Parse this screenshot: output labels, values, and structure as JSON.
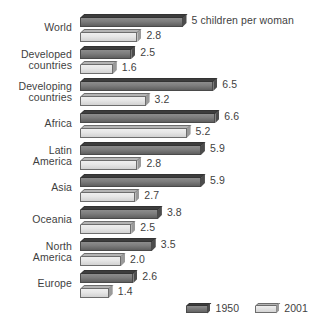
{
  "chart_data": {
    "type": "bar",
    "orientation": "horizontal",
    "title": "",
    "subtitle": "",
    "xlabel": "",
    "ylabel": "",
    "unit_note": "5 children per woman",
    "categories": [
      "World",
      "Developed\ncountries",
      "Developing\ncountries",
      "Africa",
      "Latin\nAmerica",
      "Asia",
      "Oceania",
      "North\nAmerica",
      "Europe"
    ],
    "series": [
      {
        "name": "1950",
        "color": "#6b6b6b",
        "values": [
          5.0,
          2.5,
          6.5,
          6.6,
          5.9,
          5.9,
          3.8,
          3.5,
          2.6
        ],
        "labels": [
          "5 children per woman",
          "2.5",
          "6.5",
          "6.6",
          "5.9",
          "5.9",
          "3.8",
          "3.5",
          "2.6"
        ]
      },
      {
        "name": "2001",
        "color": "#e2e2e2",
        "values": [
          2.8,
          1.6,
          3.2,
          5.2,
          2.8,
          2.7,
          2.5,
          2.0,
          1.4
        ],
        "labels": [
          "2.8",
          "1.6",
          "3.2",
          "5.2",
          "2.8",
          "2.7",
          "2.5",
          "2.0",
          "1.4"
        ]
      }
    ],
    "xlim": [
      0,
      7
    ],
    "grid": false,
    "legend_position": "bottom-right"
  },
  "legend": {
    "entries": [
      {
        "label": "1950"
      },
      {
        "label": "2001"
      }
    ]
  }
}
